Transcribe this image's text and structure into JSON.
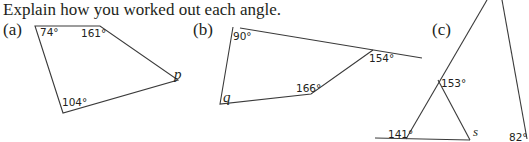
{
  "instruction": "Explain how you worked out each angle.",
  "parts": [
    {
      "label": "(a)",
      "angles": [
        "74°",
        "161°",
        "104°"
      ],
      "unknown": "p"
    },
    {
      "label": "(b)",
      "angles": [
        "90°",
        "154°",
        "166°"
      ],
      "unknown": "q"
    },
    {
      "label": "(c)",
      "angles": [
        "153°",
        "141°",
        "82°"
      ],
      "unknown": "s"
    }
  ]
}
